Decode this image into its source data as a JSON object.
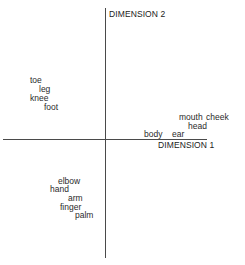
{
  "figure": {
    "type": "multidimensional-scaling-plot",
    "axes": {
      "x_label": "DIMENSION 1",
      "y_label": "DIMENSION 2"
    },
    "terms": [
      {
        "label": "toe",
        "x": 30,
        "y": 76,
        "group": "leg"
      },
      {
        "label": "leg",
        "x": 39,
        "y": 85,
        "group": "leg"
      },
      {
        "label": "knee",
        "x": 30,
        "y": 94,
        "group": "leg"
      },
      {
        "label": "foot",
        "x": 44,
        "y": 103,
        "group": "leg"
      },
      {
        "label": "mouth",
        "x": 179,
        "y": 113,
        "group": "head"
      },
      {
        "label": "cheek",
        "x": 206,
        "y": 113,
        "group": "head"
      },
      {
        "label": "head",
        "x": 188,
        "y": 122,
        "group": "head"
      },
      {
        "label": "body",
        "x": 144,
        "y": 130,
        "group": "head"
      },
      {
        "label": "ear",
        "x": 172,
        "y": 130,
        "group": "head"
      },
      {
        "label": "elbow",
        "x": 58,
        "y": 177,
        "group": "arm"
      },
      {
        "label": "hand",
        "x": 50,
        "y": 185,
        "group": "arm"
      },
      {
        "label": "arm",
        "x": 68,
        "y": 194,
        "group": "arm"
      },
      {
        "label": "finger",
        "x": 60,
        "y": 203,
        "group": "arm"
      },
      {
        "label": "palm",
        "x": 75,
        "y": 211,
        "group": "arm"
      }
    ]
  }
}
